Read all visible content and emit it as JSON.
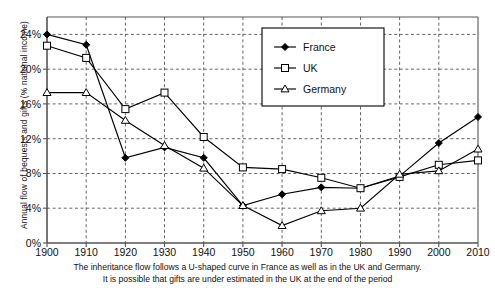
{
  "chart_data": {
    "type": "line",
    "title": "",
    "xlabel": "",
    "ylabel": "Annual flow of bequests and gifts (% national income)",
    "x": [
      1900,
      1910,
      1920,
      1930,
      1940,
      1950,
      1960,
      1970,
      1980,
      1990,
      2000,
      2010
    ],
    "categories": [
      "1900",
      "1910",
      "1920",
      "1930",
      "1940",
      "1950",
      "1960",
      "1970",
      "1980",
      "1990",
      "2000",
      "2010"
    ],
    "xlim": [
      1900,
      2010
    ],
    "ylim": [
      0,
      26
    ],
    "yticks": [
      0,
      4,
      8,
      12,
      16,
      20,
      24
    ],
    "ytick_labels": [
      "0%",
      "4%",
      "8%",
      "12%",
      "16%",
      "20%",
      "24%"
    ],
    "grid": true,
    "legend_position": "top-right",
    "series": [
      {
        "name": "France",
        "marker": "filled-diamond",
        "color": "#000000",
        "values": [
          24.0,
          22.8,
          9.8,
          11.0,
          9.8,
          4.3,
          5.6,
          6.4,
          6.3,
          7.7,
          11.5,
          14.5
        ]
      },
      {
        "name": "UK",
        "marker": "open-square",
        "color": "#000000",
        "values": [
          22.7,
          21.3,
          15.4,
          17.3,
          12.2,
          8.7,
          8.5,
          7.5,
          6.3,
          7.6,
          9.0,
          9.5
        ]
      },
      {
        "name": "Germany",
        "marker": "open-triangle",
        "color": "#000000",
        "values": [
          17.3,
          17.3,
          14.1,
          11.2,
          8.6,
          4.3,
          2.0,
          3.7,
          4.0,
          7.9,
          8.3,
          10.8
        ]
      }
    ],
    "caption_line1": "The inheritance flow follows a U-shaped curve in France as well as in the UK and Germany.",
    "caption_line2": "It is possible that gifts are under estimated in the UK at the end of the period"
  },
  "legend": {
    "entries": [
      {
        "label": "France"
      },
      {
        "label": "UK"
      },
      {
        "label": "Germany"
      }
    ]
  }
}
